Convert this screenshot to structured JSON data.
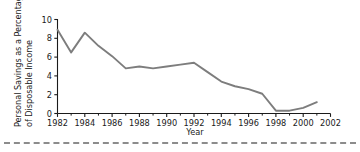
{
  "figure": {
    "name": "personal-savings-line-chart",
    "line_color": "#7d7d7d",
    "axis_color": "#1a1a1a",
    "background": "#ffffff",
    "separator_color": "#8c8c8c"
  },
  "chart_data": {
    "type": "line",
    "title": "",
    "xlabel": "Year",
    "ylabel": "Personal Savings as a Percentage of Disposable Income",
    "ylabel_line1": "Personal Savings as a Percentage",
    "ylabel_line2": "of Disposable Income",
    "xlim": [
      1982,
      2002
    ],
    "ylim": [
      0,
      10
    ],
    "yticks": [
      0,
      2,
      4,
      6,
      8,
      10
    ],
    "ytick_labels": [
      "0",
      "2",
      "4",
      "6",
      "8",
      "10"
    ],
    "xticks": [
      1982,
      1984,
      1986,
      1988,
      1990,
      1992,
      1994,
      1996,
      1998,
      2000,
      2002
    ],
    "xtick_labels": [
      "1982",
      "1984",
      "1986",
      "1988",
      "1990",
      "1992",
      "1994",
      "1996",
      "1998",
      "2000",
      "2002"
    ],
    "xminor_ticks": [
      1983,
      1985,
      1987,
      1989,
      1991,
      1993,
      1995,
      1997,
      1999,
      2001
    ],
    "grid": false,
    "legend": false,
    "x": [
      1982,
      1983,
      1984,
      1985,
      1986,
      1987,
      1988,
      1989,
      1990,
      1991,
      1992,
      1993,
      1994,
      1995,
      1996,
      1997,
      1998,
      1999,
      2000,
      2001
    ],
    "values": [
      8.9,
      6.5,
      8.6,
      7.2,
      6.1,
      4.8,
      5.0,
      4.8,
      5.0,
      5.2,
      5.4,
      4.4,
      3.4,
      2.9,
      2.6,
      2.1,
      0.3,
      0.3,
      0.6,
      1.2
    ],
    "series": [
      {
        "name": "Personal savings rate",
        "values": [
          8.9,
          6.5,
          8.6,
          7.2,
          6.1,
          4.8,
          5.0,
          4.8,
          5.0,
          5.2,
          5.4,
          4.4,
          3.4,
          2.9,
          2.6,
          2.1,
          0.3,
          0.3,
          0.6,
          1.2
        ]
      }
    ]
  }
}
